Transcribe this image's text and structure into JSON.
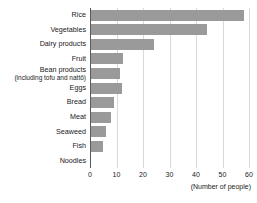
{
  "chart_data": {
    "type": "bar",
    "orientation": "horizontal",
    "title": "",
    "xlabel": "(Number of people)",
    "ylabel": "",
    "xlim": [
      0,
      60
    ],
    "xticks": [
      0,
      10,
      20,
      30,
      40,
      50,
      60
    ],
    "grid": true,
    "legend": false,
    "bar_color": "#9a9a9a",
    "grid_color": "#d9d9d9",
    "axis_color": "#5a5a5a",
    "categories": [
      "Rice",
      "Vegetables",
      "Dairy products",
      "Fruit",
      "Bean products",
      "Eggs",
      "Bread",
      "Meat",
      "Seaweed",
      "Fish",
      "Noodles"
    ],
    "category_sublabels": [
      "",
      "",
      "",
      "",
      "(including tofu and nattō)",
      "",
      "",
      "",
      "",
      "",
      ""
    ],
    "values": [
      58,
      44,
      24,
      12.5,
      11.5,
      12,
      9,
      8,
      6,
      5,
      0.5
    ]
  }
}
